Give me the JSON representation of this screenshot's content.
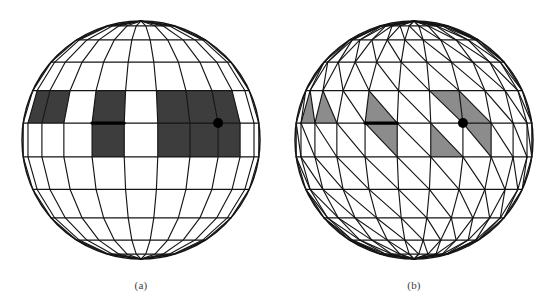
{
  "figure": {
    "background_color": "#ffffff",
    "panel_count": 2,
    "caption_a": "(a)",
    "caption_b": "(b)"
  },
  "style": {
    "line_color": "#151515",
    "bold_line_color": "#000000",
    "marker_color": "#000000",
    "shade_dark": "#3d3d3d",
    "shade_light": "#8c8c8c",
    "line_width": 1.15,
    "bold_line_width": 3.2,
    "marker_radius": 5
  },
  "panels": [
    {
      "id": "a",
      "label": "(a)",
      "mesh_type": "quadrilateral",
      "center_x": 141,
      "center_y": 140,
      "radius": 119,
      "meridians": 11,
      "parallels": 11,
      "shade_color": "#3d3d3d",
      "shaded_cells": [
        {
          "col": 1,
          "row": 4
        },
        {
          "col": 2,
          "row": 4
        },
        {
          "col": 4,
          "row": 4
        },
        {
          "col": 4,
          "row": 5
        },
        {
          "col": 6,
          "row": 4
        },
        {
          "col": 6,
          "row": 5
        },
        {
          "col": 7,
          "row": 4
        },
        {
          "col": 7,
          "row": 5
        },
        {
          "col": 8,
          "row": 4
        },
        {
          "col": 8,
          "row": 5
        }
      ],
      "bold_edge": {
        "col_start": 4,
        "col_end": 5,
        "row": 5
      },
      "marker_vertex": {
        "col": 8,
        "row": 5
      },
      "label_x": 141,
      "label_y": 289
    },
    {
      "id": "b",
      "label": "(b)",
      "mesh_type": "triangulated",
      "center_x": 414,
      "center_y": 140,
      "radius": 119,
      "meridians": 11,
      "parallels": 11,
      "shade_color": "#8c8c8c",
      "shaded_triangles": [
        {
          "col": 1,
          "row": 4,
          "half": "lower"
        },
        {
          "col": 2,
          "row": 4,
          "half": "lower"
        },
        {
          "col": 4,
          "row": 4,
          "half": "lower"
        },
        {
          "col": 4,
          "row": 5,
          "half": "upper"
        },
        {
          "col": 6,
          "row": 4,
          "half": "upper"
        },
        {
          "col": 7,
          "row": 4,
          "half": "lower"
        },
        {
          "col": 6,
          "row": 5,
          "half": "lower"
        },
        {
          "col": 7,
          "row": 5,
          "half": "upper"
        }
      ],
      "bold_edge": {
        "col_start": 4,
        "col_end": 5,
        "row": 5
      },
      "marker_vertex": {
        "col": 7,
        "row": 5
      },
      "label_x": 414,
      "label_y": 289
    }
  ]
}
